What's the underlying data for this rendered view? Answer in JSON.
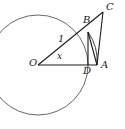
{
  "figure": {
    "type": "geometry-diagram",
    "width": 125,
    "height": 129,
    "background_color": "#ffffff",
    "stroke_color": "#1a1a1a",
    "circle_stroke_color": "#4a4a4a"
  },
  "circle": {
    "center_x": 38,
    "center_y": 65,
    "radius": 50,
    "name": "unit-circle"
  },
  "points": {
    "O": {
      "label": "O",
      "x": 38,
      "y": 65,
      "label_x": 29,
      "label_y": 60
    },
    "A": {
      "label": "A",
      "x": 97,
      "y": 65,
      "label_x": 101,
      "label_y": 62
    },
    "B": {
      "label": "B",
      "x": 88,
      "y": 32,
      "label_x": 84,
      "label_y": 18
    },
    "C": {
      "label": "C",
      "x": 103,
      "y": 12,
      "label_x": 105,
      "label_y": 3
    },
    "D": {
      "label": "D",
      "x": 88,
      "y": 65,
      "label_x": 84,
      "label_y": 67
    }
  },
  "labels": {
    "radius": {
      "text": "1",
      "x": 58,
      "y": 37
    },
    "angle": {
      "text": "x",
      "x": 57,
      "y": 53
    }
  },
  "segments": [
    {
      "name": "segment-OA",
      "from": "O",
      "to": "A"
    },
    {
      "name": "segment-OC",
      "from": "O",
      "to": "C"
    },
    {
      "name": "segment-CA",
      "from": "C",
      "to": "A"
    },
    {
      "name": "segment-BD",
      "from": "B",
      "to": "D"
    },
    {
      "name": "segment-BA",
      "from": "B",
      "to": "A"
    }
  ],
  "arcs": [
    {
      "name": "arc-BA",
      "from": "B",
      "to": "A",
      "description": "circle arc from B to A"
    }
  ]
}
